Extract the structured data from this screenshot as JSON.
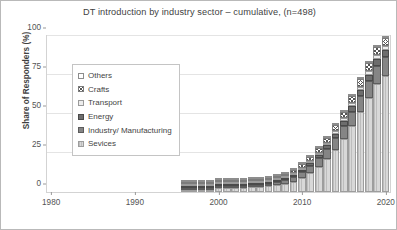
{
  "chart_data": {
    "type": "bar",
    "title": "DT introduction by industry sector – cumulative, (n=498)",
    "xlabel": "",
    "ylabel": "Share of Responders (%)",
    "stacked": true,
    "grid": true,
    "legend_position": "inside-upper-left",
    "ylim": [
      0,
      100
    ],
    "yticks": [
      0,
      25,
      50,
      75,
      100
    ],
    "xlim": [
      1980,
      2020
    ],
    "xticks": [
      1980,
      1990,
      2000,
      2010,
      2020
    ],
    "categories": [
      1980,
      1981,
      1982,
      1983,
      1984,
      1985,
      1986,
      1987,
      1988,
      1989,
      1990,
      1991,
      1992,
      1993,
      1994,
      1995,
      1996,
      1997,
      1998,
      1999,
      2000,
      2001,
      2002,
      2003,
      2004,
      2005,
      2006,
      2007,
      2008,
      2009,
      2010,
      2011,
      2012,
      2013,
      2014,
      2015,
      2016,
      2017,
      2018,
      2019,
      2020
    ],
    "series": [
      {
        "name": "Sevices",
        "color": "#d0d0d0",
        "values": [
          0,
          0,
          0,
          0,
          0,
          0,
          0,
          0,
          0,
          0,
          0,
          0,
          0,
          0,
          0,
          0,
          1.4,
          1.4,
          1.0,
          1.6,
          2.4,
          2.4,
          2.6,
          2.8,
          3.0,
          3.2,
          3.6,
          4.4,
          5.4,
          6.6,
          9.0,
          12.0,
          16.0,
          21.0,
          27.0,
          34.0,
          42.0,
          51.0,
          60.0,
          69.0,
          75.0
        ]
      },
      {
        "name": "Industry/ Manufacturing",
        "color": "#858585",
        "values": [
          0,
          0,
          0,
          0,
          0,
          0,
          0,
          0,
          0,
          0,
          0,
          0,
          0,
          0,
          0,
          0,
          0.4,
          0.4,
          0.4,
          0.6,
          0.8,
          0.8,
          0.8,
          1.0,
          1.0,
          1.2,
          1.4,
          1.8,
          2.4,
          3.0,
          3.8,
          4.6,
          5.6,
          6.6,
          7.6,
          8.6,
          9.6,
          10.6,
          11.4,
          12.0,
          12.4
        ]
      },
      {
        "name": "Energy",
        "color": "#6d6d6d",
        "values": [
          0,
          0,
          0,
          0,
          0,
          0,
          0,
          0,
          0,
          0,
          0,
          0,
          0,
          0,
          0,
          0,
          0.2,
          0.2,
          0.2,
          0.3,
          0.4,
          0.4,
          0.4,
          0.4,
          0.5,
          0.5,
          0.6,
          0.8,
          1.0,
          1.2,
          1.5,
          1.8,
          2.1,
          2.4,
          2.7,
          3.0,
          3.3,
          3.6,
          3.9,
          4.1,
          4.3
        ]
      },
      {
        "name": "Transport",
        "color": "#ededed",
        "values": [
          0,
          0,
          0,
          0,
          0,
          0,
          0,
          0,
          0,
          0,
          0,
          0,
          0,
          0,
          0,
          0,
          0.1,
          0.1,
          0.1,
          0.2,
          0.2,
          0.2,
          0.2,
          0.3,
          0.3,
          0.3,
          0.4,
          0.5,
          0.6,
          0.7,
          0.9,
          1.0,
          1.2,
          1.4,
          1.6,
          1.8,
          2.0,
          2.2,
          2.4,
          2.5,
          2.6
        ]
      },
      {
        "name": "Crafts",
        "color": "#555555",
        "values": [
          0,
          0,
          0,
          0,
          0,
          0,
          0,
          0,
          0,
          0,
          0,
          0,
          0,
          0,
          0,
          0,
          0.3,
          0.3,
          0.3,
          0.4,
          0.6,
          0.6,
          0.6,
          0.7,
          0.8,
          0.8,
          1.0,
          1.2,
          1.5,
          1.8,
          2.2,
          2.6,
          3.0,
          3.4,
          3.8,
          4.2,
          4.5,
          4.8,
          5.0,
          5.2,
          5.3
        ]
      },
      {
        "name": "Others",
        "color": "#ffffff",
        "values": [
          0,
          0,
          0,
          0,
          0,
          0,
          0,
          0,
          0,
          0,
          0,
          0,
          0,
          0,
          0,
          0,
          0.1,
          0.1,
          0.1,
          0.1,
          0.2,
          0.2,
          0.2,
          0.2,
          0.2,
          0.2,
          0.2,
          0.3,
          0.3,
          0.4,
          0.4,
          0.5,
          0.5,
          0.6,
          0.7,
          0.7,
          0.8,
          0.8,
          0.9,
          0.9,
          1.0
        ]
      }
    ],
    "totals": [
      0,
      0,
      0,
      0,
      0,
      0,
      0,
      0,
      0,
      0,
      0,
      0,
      0,
      0,
      0,
      0,
      2.5,
      2.5,
      2.1,
      3.2,
      4.6,
      4.6,
      4.8,
      5.4,
      5.8,
      6.2,
      7.2,
      9.0,
      11.2,
      13.7,
      17.8,
      22.5,
      28.4,
      35.4,
      43.4,
      52.3,
      62.2,
      73.0,
      83.6,
      93.7,
      100.7
    ]
  },
  "legend": {
    "items": [
      {
        "label": "Others"
      },
      {
        "label": "Crafts"
      },
      {
        "label": "Transport"
      },
      {
        "label": "Energy"
      },
      {
        "label": "Industry/ Manufacturing"
      },
      {
        "label": "Sevices"
      }
    ]
  },
  "axes": {
    "ytick_labels": [
      "0",
      "25",
      "50",
      "75",
      "100"
    ],
    "xtick_labels": [
      "1980",
      "1990",
      "2000",
      "2010",
      "2020"
    ]
  }
}
